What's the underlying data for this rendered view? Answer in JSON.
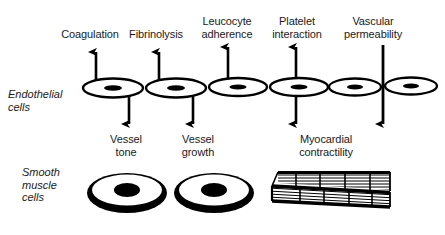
{
  "figure": {
    "background_color": "#ffffff",
    "ink_color": "#000000"
  },
  "row_labels": [
    {
      "id": "endothelial",
      "text": "Endothelial\ncells",
      "x": 8,
      "y": 88
    },
    {
      "id": "smooth-muscle",
      "text": "Smooth\nmuscle\ncells",
      "x": 22,
      "y": 166
    }
  ],
  "endothelial": {
    "functions": [
      {
        "id": "coagulation",
        "label": "Coagulation",
        "label_x": 52,
        "label_y": 28,
        "label_w": 76,
        "up_arrow": true,
        "down_arrow": true
      },
      {
        "id": "fibrinolysis",
        "label": "Fibrinolysis",
        "label_x": 120,
        "label_y": 28,
        "label_w": 72,
        "up_arrow": true,
        "down_arrow": true
      },
      {
        "id": "leucocyte-adherence",
        "label": "Leucocyte\nadherence",
        "label_x": 192,
        "label_y": 15,
        "label_w": 70,
        "up_arrow": true,
        "down_arrow": false
      },
      {
        "id": "platelet-interaction",
        "label": "Platelet\ninteraction",
        "label_x": 262,
        "label_y": 15,
        "label_w": 70,
        "up_arrow": true,
        "down_arrow": true
      },
      {
        "id": "vascular-permeability",
        "label": "Vascular\npermeability",
        "label_x": 330,
        "label_y": 15,
        "label_w": 86,
        "up_arrow": false,
        "down_arrow": true
      }
    ],
    "cells": [
      {
        "id": "endothelial-cell-1",
        "cx": 113,
        "cy": 88,
        "rx": 30,
        "ry": 9.5
      },
      {
        "id": "endothelial-cell-2",
        "cx": 176,
        "cy": 88,
        "rx": 30,
        "ry": 9.5
      },
      {
        "id": "endothelial-cell-3",
        "cx": 238,
        "cy": 87,
        "rx": 29,
        "ry": 9.0
      },
      {
        "id": "endothelial-cell-4",
        "cx": 299,
        "cy": 87,
        "rx": 29,
        "ry": 9.0
      },
      {
        "id": "endothelial-cell-5",
        "cx": 355,
        "cy": 87,
        "rx": 26,
        "ry": 8.5
      },
      {
        "id": "endothelial-cell-6",
        "cx": 411,
        "cy": 86,
        "rx": 26,
        "ry": 8.5
      }
    ]
  },
  "smooth_muscle": {
    "functions": [
      {
        "id": "vessel-tone",
        "label": "Vessel\ntone",
        "label_x": 96,
        "label_y": 133,
        "label_w": 60
      },
      {
        "id": "vessel-growth",
        "label": "Vessel\ngrowth",
        "label_x": 168,
        "label_y": 133,
        "label_w": 60
      },
      {
        "id": "myocardial-contractility",
        "label": "Myocardial\ncontractility",
        "label_x": 278,
        "label_y": 133,
        "label_w": 96
      }
    ],
    "cells": [
      {
        "id": "smooth-muscle-cell-1",
        "cx": 127,
        "cy": 192,
        "rx": 40,
        "ry": 20
      },
      {
        "id": "smooth-muscle-cell-2",
        "cx": 214,
        "cy": 192,
        "rx": 40,
        "ry": 20
      }
    ],
    "myocyte": {
      "id": "myocardial-fiber",
      "striation_count": 18,
      "description": "striated myocardial fibre wedge"
    }
  }
}
